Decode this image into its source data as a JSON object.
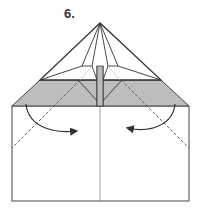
{
  "diagram": {
    "step_label": "6.",
    "type": "origami-fold-instruction",
    "colors": {
      "line": "#333333",
      "shaded_band": "#bdbdbd",
      "paper": "#ffffff",
      "dashed": "#555555"
    },
    "elements": {
      "folded_triangle": "top triangular flap with inner kite folds",
      "shaded_band": "gray colored side of paper strip",
      "paper_body": "white rectangle with center crease",
      "left_valley_fold": "dashed diagonal line on left",
      "right_valley_fold": "dashed diagonal line on right",
      "left_arrow": "curved arrow folding left corner toward center",
      "right_arrow": "curved arrow folding right corner toward center"
    }
  }
}
